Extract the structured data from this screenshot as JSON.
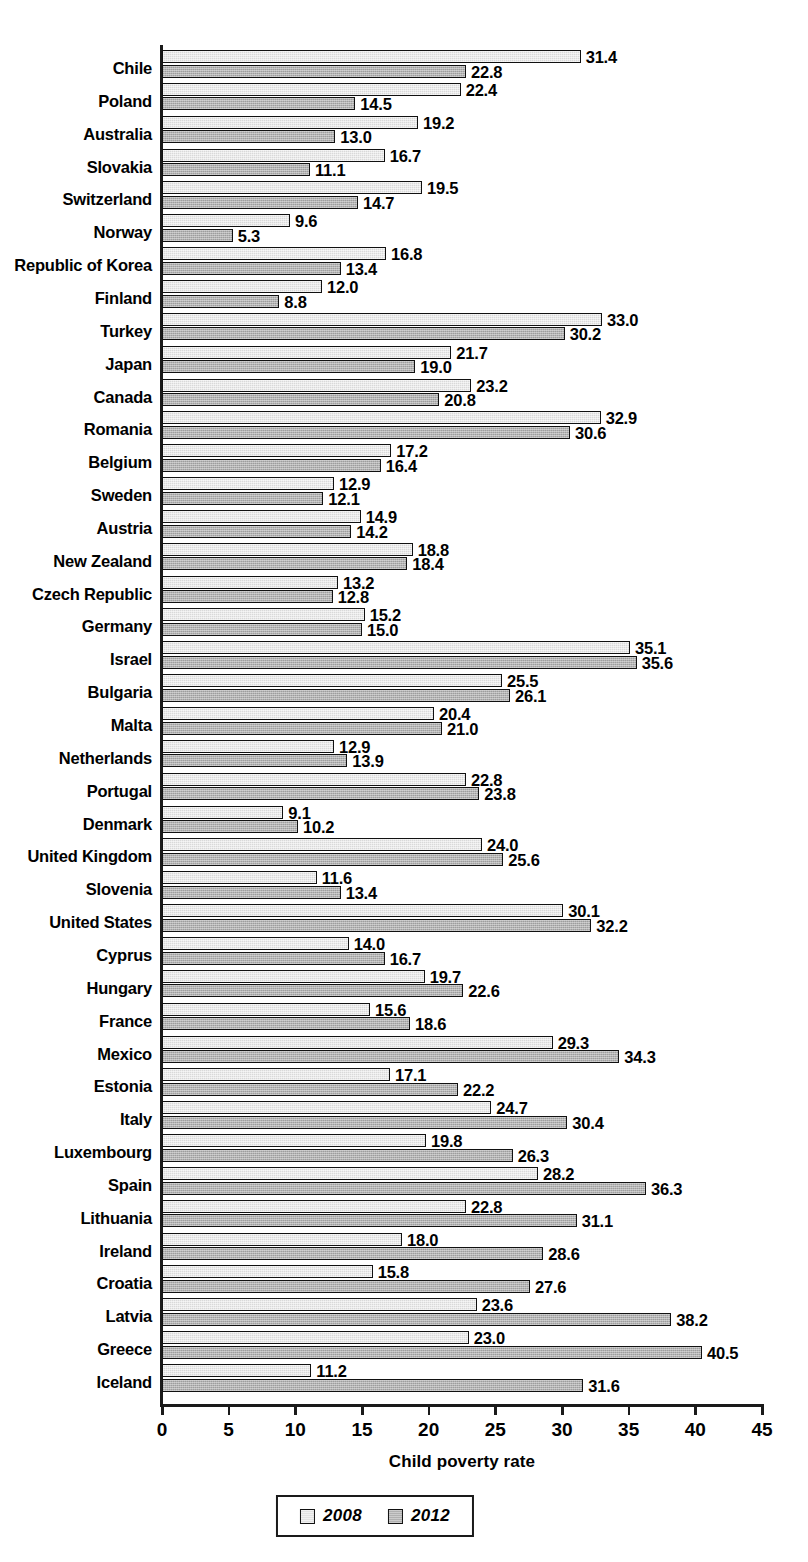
{
  "chart_data": {
    "type": "bar",
    "orientation": "horizontal",
    "title": "",
    "xlabel": "Child poverty rate",
    "ylabel": "",
    "xlim": [
      0,
      45
    ],
    "xticks": [
      "0",
      "5",
      "10",
      "15",
      "20",
      "25",
      "30",
      "35",
      "40",
      "45"
    ],
    "grid": false,
    "legend_position": "bottom-center",
    "categories": [
      "Chile",
      "Poland",
      "Australia",
      "Slovakia",
      "Switzerland",
      "Norway",
      "Republic of Korea",
      "Finland",
      "Turkey",
      "Japan",
      "Canada",
      "Romania",
      "Belgium",
      "Sweden",
      "Austria",
      "New Zealand",
      "Czech Republic",
      "Germany",
      "Israel",
      "Bulgaria",
      "Malta",
      "Netherlands",
      "Portugal",
      "Denmark",
      "United Kingdom",
      "Slovenia",
      "United States",
      "Cyprus",
      "Hungary",
      "France",
      "Mexico",
      "Estonia",
      "Italy",
      "Luxembourg",
      "Spain",
      "Lithuania",
      "Ireland",
      "Croatia",
      "Latvia",
      "Greece",
      "Iceland"
    ],
    "series": [
      {
        "name": "2008",
        "color": "#d9d9d9",
        "values": [
          31.4,
          22.4,
          19.2,
          16.7,
          19.5,
          9.6,
          16.8,
          12.0,
          33.0,
          21.7,
          23.2,
          32.9,
          17.2,
          12.9,
          14.9,
          18.8,
          13.2,
          15.2,
          35.1,
          25.5,
          20.4,
          12.9,
          22.8,
          9.1,
          24.0,
          11.6,
          30.1,
          14.0,
          19.7,
          15.6,
          29.3,
          17.1,
          24.7,
          19.8,
          28.2,
          22.8,
          18.0,
          15.8,
          23.6,
          23.0,
          11.2
        ]
      },
      {
        "name": "2012",
        "color": "#b3b3b3",
        "values": [
          22.8,
          14.5,
          13.0,
          11.1,
          14.7,
          5.3,
          13.4,
          8.8,
          30.2,
          19.0,
          20.8,
          30.6,
          16.4,
          12.1,
          14.2,
          18.4,
          12.8,
          15.0,
          35.6,
          26.1,
          21.0,
          13.9,
          23.8,
          10.2,
          25.6,
          13.4,
          32.2,
          16.7,
          22.6,
          18.6,
          34.3,
          22.2,
          30.4,
          26.3,
          36.3,
          31.1,
          28.6,
          27.6,
          38.2,
          40.5,
          31.6
        ]
      }
    ]
  },
  "legend": {
    "items": [
      {
        "label": "2008"
      },
      {
        "label": "2012"
      }
    ]
  },
  "axis": {
    "x_title": "Child poverty rate"
  }
}
